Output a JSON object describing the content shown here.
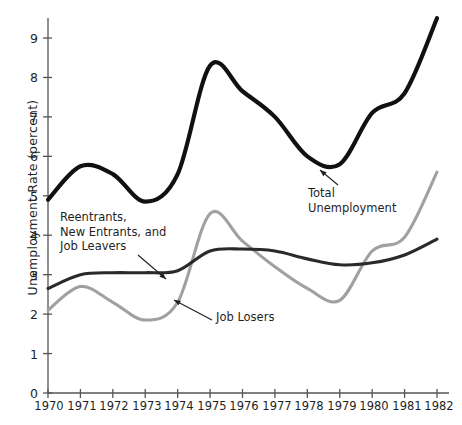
{
  "chart_data": {
    "type": "line",
    "title": "",
    "xlabel": "",
    "ylabel": "Unemployment Rate (percent)",
    "xlim": [
      1970,
      1982
    ],
    "ylim": [
      0,
      9.6
    ],
    "grid": false,
    "legend_position": "inline-annotations",
    "x": [
      1970,
      1971,
      1972,
      1973,
      1974,
      1975,
      1976,
      1977,
      1978,
      1979,
      1980,
      1981,
      1982
    ],
    "xtick_labels": [
      "1970",
      "1971",
      "1972",
      "1973",
      "1974",
      "1975",
      "1976",
      "1977",
      "1978",
      "1979",
      "1980",
      "1981",
      "1982"
    ],
    "ytick_labels": [
      "0",
      "1",
      "2",
      "3",
      "4",
      "5",
      "6",
      "7",
      "8",
      "9"
    ],
    "ytick_values": [
      0,
      1,
      2,
      3,
      4,
      5,
      6,
      7,
      8,
      9
    ],
    "series": [
      {
        "name": "Total Unemployment",
        "color": "#111111",
        "width": 4.2,
        "values": [
          4.9,
          5.75,
          5.55,
          4.85,
          5.55,
          8.3,
          7.65,
          7.0,
          6.0,
          5.8,
          7.1,
          7.6,
          9.5
        ]
      },
      {
        "name": "Reentrants, New Entrants, and Job Leavers",
        "color": "#2a2a2a",
        "width": 3.1,
        "values": [
          2.65,
          3.0,
          3.05,
          3.05,
          3.1,
          3.6,
          3.65,
          3.6,
          3.4,
          3.25,
          3.3,
          3.5,
          3.9
        ]
      },
      {
        "name": "Job Losers",
        "color": "#a0a0a0",
        "width": 3.1,
        "values": [
          2.1,
          2.7,
          2.3,
          1.85,
          2.3,
          4.55,
          3.85,
          3.2,
          2.65,
          2.35,
          3.6,
          3.95,
          5.6
        ]
      }
    ],
    "annotations": [
      {
        "id": "reentrants",
        "text": "Reentrants,\nNew Entrants, and\nJob Leavers",
        "arrow_from": [
          138,
          255
        ],
        "arrow_to": [
          166,
          279
        ]
      },
      {
        "id": "job-losers",
        "text": "Job Losers",
        "arrow_from": [
          212,
          320
        ],
        "arrow_to": [
          174,
          300
        ]
      },
      {
        "id": "total-unemployment",
        "text": "Total\nUnemployment",
        "arrow_from": [
          338,
          185
        ],
        "arrow_to": [
          320,
          170
        ]
      }
    ]
  },
  "colors": {
    "axis": "#555555",
    "total": "#111111",
    "reentrants": "#2a2a2a",
    "joblosers": "#a0a0a0",
    "text": "#1f1f1f"
  }
}
